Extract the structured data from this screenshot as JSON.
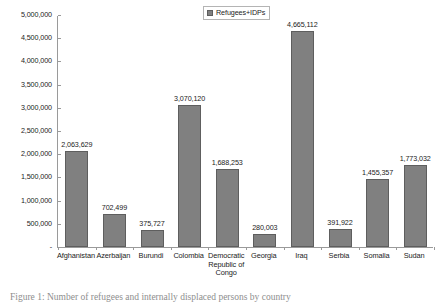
{
  "chart_data": {
    "type": "bar",
    "title": "",
    "xlabel": "",
    "ylabel": "",
    "categories": [
      "Afghanistan",
      "Azerbaijan",
      "Burundi",
      "Colombia",
      "Democratic Republic of Congo",
      "Georgia",
      "Iraq",
      "Serbia",
      "Somalia",
      "Sudan"
    ],
    "category_lines": [
      [
        "Afghanistan"
      ],
      [
        "Azerbaijan"
      ],
      [
        "Burundi"
      ],
      [
        "Colombia"
      ],
      [
        "Democratic",
        "Republic of",
        "Congo"
      ],
      [
        "Georgia"
      ],
      [
        "Iraq"
      ],
      [
        "Serbia"
      ],
      [
        "Somalia"
      ],
      [
        "Sudan"
      ]
    ],
    "series": [
      {
        "name": "Refugees+IDPs",
        "values": [
          2063629,
          702499,
          375727,
          3070120,
          1688253,
          280003,
          4665112,
          391922,
          1455357,
          1773032
        ],
        "value_labels": [
          "2,063,629",
          "702,499",
          "375,727",
          "3,070,120",
          "1,688,253",
          "280,003",
          "4,665,112",
          "391,922",
          "1,455,357",
          "1,773,032"
        ],
        "color": "#808080"
      }
    ],
    "ylim": [
      0,
      5000000
    ],
    "ytick_values": [
      0,
      500000,
      1000000,
      1500000,
      2000000,
      2500000,
      3000000,
      3500000,
      4000000,
      4500000,
      5000000
    ],
    "ytick_labels": [
      "-",
      "500,000",
      "1,000,000",
      "1,500,000",
      "2,000,000",
      "2,500,000",
      "3,000,000",
      "3,500,000",
      "4,000,000",
      "4,500,000",
      "5,000,000"
    ],
    "grid": false,
    "legend": {
      "position": "top-right",
      "entries": [
        "Refugees+IDPs"
      ]
    }
  },
  "legend": {
    "label": "Refugees+IDPs"
  },
  "caption": {
    "text": "Figure 1: Number of refugees and internally displaced persons by country"
  }
}
